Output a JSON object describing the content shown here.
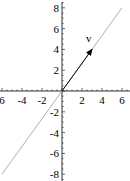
{
  "chart_data": {
    "type": "line",
    "title": "",
    "xlabel": "",
    "ylabel": "",
    "xlim": [
      -6,
      6
    ],
    "ylim": [
      -8,
      8
    ],
    "grid": false,
    "x_ticks": [
      -6,
      -4,
      -2,
      2,
      4,
      6
    ],
    "x_tick_labels": [
      "6",
      "-4",
      "-2",
      "2",
      "4",
      "6"
    ],
    "y_ticks": [
      8,
      6,
      4,
      2,
      -2,
      -4,
      -6,
      -8
    ],
    "y_tick_labels": [
      "8",
      "6",
      "4",
      "2",
      "-2",
      "-4",
      "-6",
      "-8"
    ],
    "series": [
      {
        "name": "span line",
        "x": [
          -6,
          6
        ],
        "y": [
          -8,
          8
        ],
        "color": "#999999"
      },
      {
        "name": "v",
        "x": [
          0,
          3
        ],
        "y": [
          0,
          4
        ],
        "color": "#000000",
        "arrow": true
      }
    ],
    "annotations": [
      {
        "text": "v",
        "x": 2.4,
        "y": 4.7
      }
    ]
  },
  "labels": {
    "vector": "v"
  }
}
